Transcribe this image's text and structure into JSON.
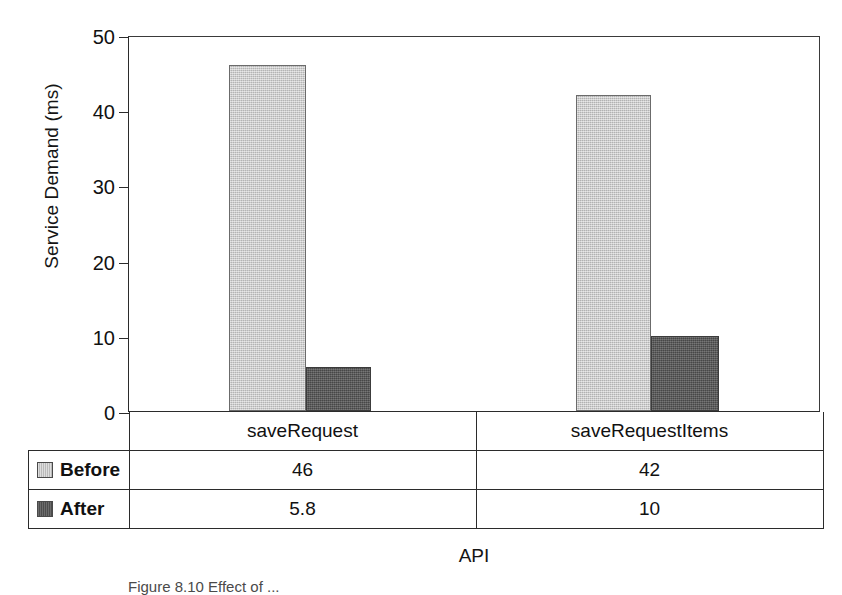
{
  "chart_data": {
    "type": "bar",
    "title": "",
    "xlabel": "API",
    "ylabel": "Service Demand (ms)",
    "categories": [
      "saveRequest",
      "saveRequestItems"
    ],
    "series": [
      {
        "name": "Before",
        "values": [
          46,
          42
        ],
        "display_values": [
          "46",
          "42"
        ],
        "color": "#c8c8c8"
      },
      {
        "name": "After",
        "values": [
          5.8,
          10
        ],
        "display_values": [
          "5.8",
          "10"
        ],
        "color": "#585858"
      }
    ],
    "ylim": [
      0,
      50
    ],
    "yticks": [
      0,
      10,
      20,
      30,
      40,
      50
    ],
    "ytick_labels": [
      "0",
      "10",
      "20",
      "30",
      "40",
      "50"
    ],
    "grid": false,
    "legend_position": "data-table-left",
    "bar_gap_within_group": 0
  },
  "table": {
    "legend_header": "",
    "column_headers": [
      "saveRequest",
      "saveRequestItems"
    ],
    "rows": [
      {
        "label": "Before",
        "swatch": "light",
        "cells": [
          "46",
          "42"
        ]
      },
      {
        "label": "After",
        "swatch": "dark",
        "cells": [
          "5.8",
          "10"
        ]
      }
    ]
  },
  "caption": {
    "text": "Figure 8.10   Effect of ..."
  },
  "colors": {
    "before": "#c8c8c8",
    "after": "#585858",
    "axis": "#2b2b2b",
    "text": "#111111",
    "background": "#ffffff"
  }
}
